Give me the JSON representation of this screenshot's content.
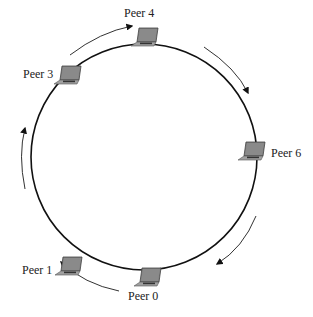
{
  "diagram": {
    "type": "ring-topology",
    "ring": {
      "cx": 144,
      "cy": 157,
      "r": 113,
      "stroke": "#111111"
    },
    "direction": "clockwise",
    "peers": [
      {
        "id": "peer-4",
        "label": "Peer 4",
        "angle_deg": -91,
        "label_x": 124,
        "label_y": 6
      },
      {
        "id": "peer-3",
        "label": "Peer 3",
        "angle_deg": -133,
        "label_x": 23,
        "label_y": 67
      },
      {
        "id": "peer-6",
        "label": "Peer 6",
        "angle_deg": -4,
        "label_x": 272,
        "label_y": 145
      },
      {
        "id": "peer-1",
        "label": "Peer 1",
        "angle_deg": 130,
        "label_x": 24,
        "label_y": 262
      },
      {
        "id": "peer-0",
        "label": "Peer 0",
        "angle_deg": 91,
        "label_x": 128,
        "label_y": 288
      }
    ],
    "arrows": [
      {
        "id": "arrow-3-to-4",
        "from": "Peer 3",
        "to": "Peer 4"
      },
      {
        "id": "arrow-4-to-6",
        "from": "Peer 4",
        "to": "Peer 6"
      },
      {
        "id": "arrow-6-to-0",
        "from": "Peer 6",
        "to": "Peer 0"
      },
      {
        "id": "arrow-0-to-1",
        "from": "Peer 0",
        "to": "Peer 1"
      },
      {
        "id": "arrow-1-to-3",
        "from": "Peer 1",
        "to": "Peer 3"
      }
    ],
    "icon": "laptop-icon",
    "colors": {
      "line": "#111111",
      "arrow": "#333333",
      "laptop_screen": "#7a7a7a",
      "laptop_base": "#9a9a9a",
      "text": "#222222"
    }
  }
}
